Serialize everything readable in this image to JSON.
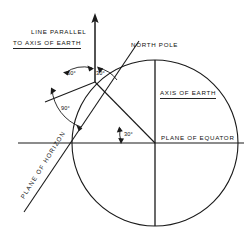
{
  "diagram": {
    "title_present": false,
    "background_color": "#ffffff",
    "stroke_color": "#1a1a1a",
    "labels": {
      "line_parallel_1": "LINE PARALLEL",
      "line_parallel_2": "TO AXIS OF EARTH",
      "north_pole": "NORTH POLE",
      "axis_of_earth": "AXIS OF EARTH",
      "plane_of_equator": "PLANE OF EQUATOR",
      "plane_of_horizon": "PLANE OF HORIZON"
    },
    "angles": {
      "sixty": "60°",
      "thirty_vertex": "30°",
      "ninety": "90°",
      "thirty_equator": "30°"
    },
    "geometry": {
      "circle_center_x": 155,
      "circle_center_y": 143,
      "circle_radius": 83,
      "vertex_x": 95,
      "vertex_y": 82,
      "arrow_top_y": 14,
      "equator_y": 143,
      "axis_x": 155
    }
  }
}
